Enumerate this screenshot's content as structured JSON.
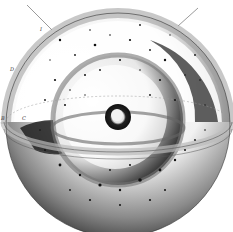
{
  "illustration": {
    "subject": "nested-cosmological-spheres-engraving",
    "labels": [
      {
        "text": "I",
        "x": 40,
        "y": 29
      },
      {
        "text": "D",
        "x": 10,
        "y": 69
      },
      {
        "text": "B",
        "x": 1,
        "y": 118
      },
      {
        "text": "C",
        "x": 22,
        "y": 118
      }
    ],
    "colors": {
      "paper": "#ffffff",
      "ink": "#111111",
      "mid_shade": "#7a7a7a",
      "light_shade": "#d8d8d8"
    },
    "geometry": {
      "outer_sphere": {
        "cx": 118,
        "cy": 125,
        "r": 112
      },
      "middle_sphere": {
        "cx": 118,
        "cy": 120,
        "r": 65
      },
      "inner_core": {
        "cx": 118,
        "cy": 117,
        "r": 13
      },
      "equator_band": {
        "cx": 118,
        "cy": 122,
        "rx": 116,
        "ry": 32
      }
    },
    "stars": [
      [
        60,
        40,
        1.2
      ],
      [
        75,
        55,
        0.9
      ],
      [
        95,
        45,
        1.3
      ],
      [
        110,
        35,
        0.8
      ],
      [
        130,
        40,
        1.1
      ],
      [
        150,
        50,
        0.9
      ],
      [
        165,
        60,
        1.2
      ],
      [
        85,
        75,
        1.0
      ],
      [
        70,
        90,
        0.8
      ],
      [
        55,
        80,
        1.1
      ],
      [
        100,
        70,
        0.9
      ],
      [
        120,
        60,
        1.0
      ],
      [
        140,
        70,
        0.8
      ],
      [
        160,
        80,
        1.1
      ],
      [
        45,
        100,
        0.9
      ],
      [
        65,
        105,
        1.0
      ],
      [
        85,
        95,
        0.7
      ],
      [
        150,
        95,
        0.9
      ],
      [
        175,
        100,
        1.0
      ],
      [
        185,
        75,
        0.8
      ],
      [
        50,
        60,
        0.7
      ],
      [
        90,
        30,
        0.8
      ],
      [
        140,
        25,
        0.9
      ],
      [
        170,
        35,
        0.7
      ],
      [
        195,
        55,
        0.9
      ],
      [
        200,
        80,
        0.8
      ],
      [
        205,
        105,
        0.7
      ],
      [
        40,
        130,
        0.8
      ],
      [
        60,
        165,
        1.4
      ],
      [
        80,
        175,
        1.2
      ],
      [
        100,
        185,
        1.6
      ],
      [
        120,
        190,
        1.2
      ],
      [
        140,
        180,
        1.8
      ],
      [
        160,
        170,
        1.4
      ],
      [
        175,
        160,
        1.2
      ],
      [
        185,
        150,
        1.0
      ],
      [
        150,
        200,
        1.1
      ],
      [
        120,
        205,
        1.0
      ],
      [
        90,
        200,
        1.1
      ],
      [
        70,
        190,
        0.9
      ],
      [
        130,
        165,
        1.0
      ],
      [
        110,
        170,
        0.9
      ],
      [
        195,
        140,
        0.9
      ],
      [
        205,
        130,
        0.8
      ],
      [
        165,
        190,
        1.0
      ],
      [
        45,
        150,
        0.9
      ]
    ],
    "pointer_lines": [
      {
        "x1": 27,
        "y1": 5,
        "x2": 52,
        "y2": 30
      },
      {
        "x1": 198,
        "y1": 8,
        "x2": 178,
        "y2": 26
      }
    ]
  }
}
